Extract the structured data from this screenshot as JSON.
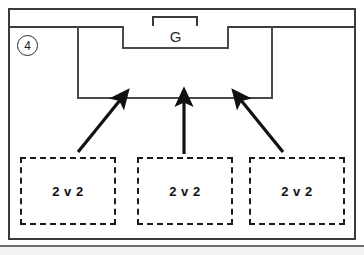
{
  "diagram": {
    "step_number": "4",
    "goal_label": "G",
    "groups": [
      {
        "label": "2 v 2"
      },
      {
        "label": "2 v 2"
      },
      {
        "label": "2 v 2"
      }
    ],
    "arrows": [
      {
        "name": "arrow-left",
        "direction": "up-right"
      },
      {
        "name": "arrow-middle",
        "direction": "up"
      },
      {
        "name": "arrow-right",
        "direction": "up-left"
      }
    ],
    "colors": {
      "line": "#3b3b3b",
      "pitch_line": "#4a4a4a",
      "dashed": "#1c1c1c",
      "arrow": "#111111",
      "background": "#ffffff"
    }
  }
}
